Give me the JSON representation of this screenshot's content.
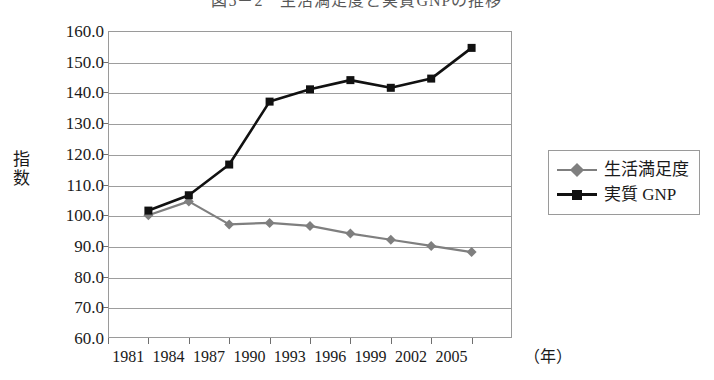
{
  "title": "図5－2　生活満足度と実質GNPの推移",
  "axes": {
    "y_title_chars": [
      "指",
      "数"
    ],
    "x_unit_label": "（年）"
  },
  "legend": {
    "items": [
      {
        "label": "生活満足度",
        "color": "#7f7f7f",
        "marker": "diamond"
      },
      {
        "label": "実質 GNP",
        "color": "#111111",
        "marker": "square"
      }
    ]
  },
  "chart_data": {
    "type": "line",
    "title": "図5－2　生活満足度と実質GNPの推移",
    "xlabel": "（年）",
    "ylabel": "指数",
    "ylim": [
      60.0,
      160.0
    ],
    "ytick_step": 10.0,
    "yticks": [
      "160.0",
      "150.0",
      "140.0",
      "130.0",
      "120.0",
      "110.0",
      "100.0",
      "90.0",
      "80.0",
      "70.0",
      "60.0"
    ],
    "ytick_values": [
      160.0,
      150.0,
      140.0,
      130.0,
      120.0,
      110.0,
      100.0,
      90.0,
      80.0,
      70.0,
      60.0
    ],
    "xtick_labels": [
      "1981",
      "1984",
      "1987",
      "1990",
      "1993",
      "1996",
      "1999",
      "2002",
      "2005"
    ],
    "x": [
      1982,
      1985,
      1988,
      1991,
      1994,
      1997,
      2000,
      2003,
      2006
    ],
    "grid": true,
    "legend_position": "right",
    "series": [
      {
        "name": "生活満足度",
        "color": "#7f7f7f",
        "marker": "diamond",
        "values": [
          100.0,
          104.5,
          97.0,
          97.5,
          96.5,
          94.0,
          92.0,
          90.0,
          88.0
        ]
      },
      {
        "name": "実質 GNP",
        "color": "#111111",
        "marker": "square",
        "values": [
          101.5,
          106.5,
          116.5,
          137.0,
          141.0,
          144.0,
          141.5,
          144.5,
          154.5
        ]
      }
    ]
  }
}
